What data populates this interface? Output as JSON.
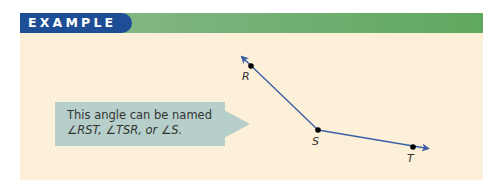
{
  "header": {
    "label": "EXAMPLE",
    "label_bg": "#1d4e96",
    "band_color": "#5fa85f"
  },
  "panel": {
    "bg": "#fcf1d8"
  },
  "callout": {
    "line1": "This angle can be named",
    "line2": "∠RST, ∠TSR, or ∠S.",
    "bg": "#b7cfca"
  },
  "diagram": {
    "points": [
      {
        "name": "R",
        "label": "R",
        "x": 251,
        "y": 66
      },
      {
        "name": "S",
        "label": "S",
        "x": 318,
        "y": 130
      },
      {
        "name": "T",
        "label": "T",
        "x": 413,
        "y": 147
      }
    ],
    "rays": [
      {
        "from": "S",
        "through": "R"
      },
      {
        "from": "S",
        "through": "T"
      }
    ],
    "line_color": "#3c5fa8",
    "point_color": "#000000"
  }
}
